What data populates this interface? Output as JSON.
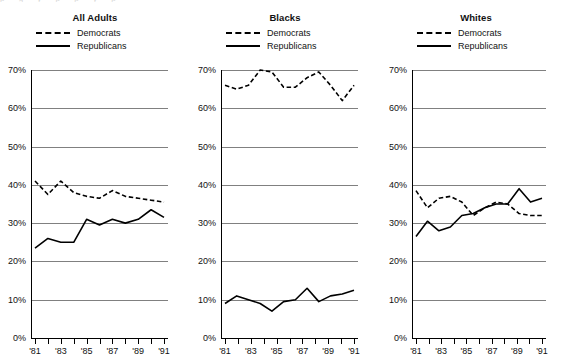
{
  "figure": {
    "cropped_header_fragment": "p g y p p y p",
    "panel_count": 3
  },
  "legend": {
    "democrats_label": "Democrats",
    "republicans_label": "Republicans",
    "democrats_style": "dashed",
    "republicans_style": "solid",
    "color": "#000000"
  },
  "axis": {
    "ytick_labels": [
      "70%",
      "60%",
      "50%",
      "40%",
      "30%",
      "20%",
      "10%",
      "0%"
    ],
    "ytick_values": [
      70,
      60,
      50,
      40,
      30,
      20,
      10,
      0
    ],
    "xtick_labels": [
      "'81",
      "'83",
      "'85",
      "'87",
      "'89",
      "'91"
    ],
    "xtick_label_years": [
      1981,
      1983,
      1985,
      1987,
      1989,
      1991
    ],
    "all_years": [
      1981,
      1982,
      1983,
      1984,
      1985,
      1986,
      1987,
      1988,
      1989,
      1990,
      1991
    ],
    "ylim": [
      0,
      70
    ],
    "gridline_color": "#808080",
    "axis_color": "#000000"
  },
  "panels": [
    {
      "title": "All Adults"
    },
    {
      "title": "Blacks"
    },
    {
      "title": "Whites"
    }
  ],
  "chart_data": [
    {
      "type": "line",
      "title": "All Adults",
      "xlabel": "",
      "ylabel": "",
      "ylim": [
        0,
        70
      ],
      "grid": true,
      "legend_position": "above-plot",
      "x": [
        1981,
        1982,
        1983,
        1984,
        1985,
        1986,
        1987,
        1988,
        1989,
        1990,
        1991
      ],
      "xtick_labels": [
        "'81",
        "'83",
        "'85",
        "'87",
        "'89",
        "'91"
      ],
      "ytick_labels": [
        "0%",
        "10%",
        "20%",
        "30%",
        "40%",
        "50%",
        "60%",
        "70%"
      ],
      "series": [
        {
          "name": "Democrats",
          "style": "dashed",
          "values": [
            41,
            37.5,
            41,
            38,
            37,
            36.5,
            38.5,
            37,
            36.5,
            36,
            35.5
          ]
        },
        {
          "name": "Republicans",
          "style": "solid",
          "values": [
            23.5,
            26,
            25,
            25,
            31,
            29.5,
            31,
            30,
            31,
            33.5,
            31.5
          ]
        }
      ]
    },
    {
      "type": "line",
      "title": "Blacks",
      "xlabel": "",
      "ylabel": "",
      "ylim": [
        0,
        70
      ],
      "grid": true,
      "legend_position": "above-plot",
      "x": [
        1981,
        1982,
        1983,
        1984,
        1985,
        1986,
        1987,
        1988,
        1989,
        1990,
        1991
      ],
      "xtick_labels": [
        "'81",
        "'83",
        "'85",
        "'87",
        "'89",
        "'91"
      ],
      "ytick_labels": [
        "0%",
        "10%",
        "20%",
        "30%",
        "40%",
        "50%",
        "60%",
        "70%"
      ],
      "series": [
        {
          "name": "Democrats",
          "style": "dashed",
          "values": [
            66,
            65,
            66,
            70,
            69.5,
            65.5,
            65.5,
            68,
            69.5,
            66,
            62,
            66
          ]
        },
        {
          "name": "Republicans",
          "style": "solid",
          "values": [
            9,
            11,
            10,
            9,
            7,
            9.5,
            10,
            13,
            9.5,
            11,
            11.5,
            12.5
          ]
        }
      ]
    },
    {
      "type": "line",
      "title": "Whites",
      "xlabel": "",
      "ylabel": "",
      "ylim": [
        0,
        70
      ],
      "grid": true,
      "legend_position": "above-plot",
      "x": [
        1981,
        1982,
        1983,
        1984,
        1985,
        1986,
        1987,
        1988,
        1989,
        1990,
        1991
      ],
      "xtick_labels": [
        "'81",
        "'83",
        "'85",
        "'87",
        "'89",
        "'91"
      ],
      "ytick_labels": [
        "0%",
        "10%",
        "20%",
        "30%",
        "40%",
        "50%",
        "60%",
        "70%"
      ],
      "series": [
        {
          "name": "Democrats",
          "style": "dashed",
          "values": [
            38.5,
            34,
            36.5,
            37,
            35.5,
            32,
            34,
            35.5,
            35,
            32.5,
            32,
            32
          ]
        },
        {
          "name": "Republicans",
          "style": "solid",
          "values": [
            26.5,
            30.5,
            28,
            29,
            32,
            32.5,
            34,
            35,
            35,
            39,
            35.5,
            36.5
          ]
        }
      ]
    }
  ]
}
